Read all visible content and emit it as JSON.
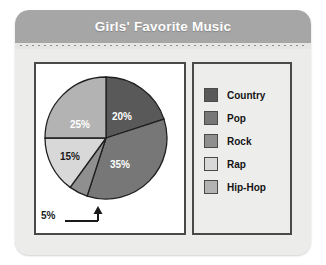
{
  "card": {
    "header_title": "Girls' Favorite Music",
    "header_color": "#a6a6a6",
    "background_color": "#ececeb",
    "border_color": "#4a4a4a"
  },
  "chart_data": {
    "type": "pie",
    "title": "Girls' Favorite Music",
    "categories": [
      "Country",
      "Pop",
      "Rock",
      "Rap",
      "Hip-Hop"
    ],
    "values": [
      20,
      35,
      5,
      15,
      25
    ],
    "value_labels": [
      "20%",
      "35%",
      "5%",
      "15%",
      "25%"
    ],
    "colors": [
      "#595959",
      "#777777",
      "#8f8f8f",
      "#d8d8d8",
      "#b3b3b3"
    ],
    "label_text_colors": [
      "#ffffff",
      "#ffffff",
      "#1a1a1a",
      "#1a1a1a",
      "#ffffff"
    ],
    "units": "percent",
    "total": 100,
    "start_angle_deg": 0,
    "direction": "clockwise",
    "legend_position": "right",
    "grid": false,
    "xlabel": "",
    "ylabel": "",
    "callout": {
      "label": "5%",
      "points_to": "Rock"
    }
  },
  "legend": {
    "items": [
      {
        "label": "Country",
        "color": "#595959"
      },
      {
        "label": "Pop",
        "color": "#777777"
      },
      {
        "label": "Rock",
        "color": "#8f8f8f"
      },
      {
        "label": "Rap",
        "color": "#d8d8d8"
      },
      {
        "label": "Hip-Hop",
        "color": "#b3b3b3"
      }
    ]
  },
  "pie_labels": [
    {
      "text": "20%",
      "x": 78,
      "y": 44,
      "tone": "light"
    },
    {
      "text": "35%",
      "x": 76,
      "y": 92,
      "tone": "light"
    },
    {
      "text": "25%",
      "x": 36,
      "y": 52,
      "tone": "light"
    },
    {
      "text": "15%",
      "x": 26,
      "y": 84,
      "tone": "dark"
    }
  ]
}
